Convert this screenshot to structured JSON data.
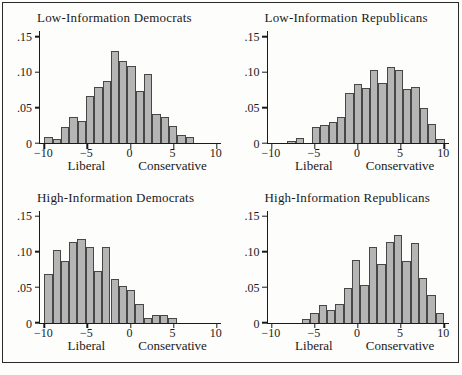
{
  "chart_data": {
    "type": "bar",
    "subtype": "histogram-small-multiples",
    "xlim": [
      -10.5,
      10.5
    ],
    "ylim": [
      0,
      0.158
    ],
    "x_tick_values": [
      -10,
      -5,
      0,
      5,
      10
    ],
    "x_tick_labels": [
      "−10",
      "−5",
      "0",
      "5",
      "10"
    ],
    "y_tick_values": [
      0,
      0.05,
      0.1,
      0.15
    ],
    "y_tick_labels": [
      "0",
      ".05",
      ".10",
      ".15"
    ],
    "xlabel_left": "Liberal",
    "xlabel_right": "Conservative",
    "xlabel_left_x": -5,
    "xlabel_right_x": 5,
    "bar_fill": "#b5b5b5",
    "bar_stroke": "#474747",
    "panels": [
      {
        "title": "Low-Information Democrats",
        "bin_start": -10,
        "bin_width": 0.965,
        "densities": [
          0.008,
          0.006,
          0.022,
          0.037,
          0.031,
          0.066,
          0.079,
          0.088,
          0.13,
          0.115,
          0.108,
          0.074,
          0.098,
          0.041,
          0.037,
          0.024,
          0.011,
          0.008
        ]
      },
      {
        "title": "Low-Information Republicans",
        "bin_start": -8.2,
        "bin_width": 0.96,
        "densities": [
          0.003,
          0.007,
          0,
          0.022,
          0.025,
          0.03,
          0.037,
          0.071,
          0.083,
          0.077,
          0.103,
          0.085,
          0.107,
          0.103,
          0.076,
          0.079,
          0.049,
          0.027,
          0.006
        ]
      },
      {
        "title": "High-Information Democrats",
        "bin_start": -10,
        "bin_width": 0.96,
        "densities": [
          0.068,
          0.103,
          0.087,
          0.113,
          0.118,
          0.107,
          0.072,
          0.106,
          0.062,
          0.051,
          0.046,
          0.026,
          0.006,
          0.01,
          0.01,
          0.006
        ]
      },
      {
        "title": "High-Information Republicans",
        "bin_start": -6.5,
        "bin_width": 0.97,
        "densities": [
          0.005,
          0.014,
          0.025,
          0.017,
          0.026,
          0.049,
          0.088,
          0.053,
          0.107,
          0.083,
          0.114,
          0.123,
          0.087,
          0.112,
          0.063,
          0.039,
          0.013
        ]
      }
    ]
  }
}
